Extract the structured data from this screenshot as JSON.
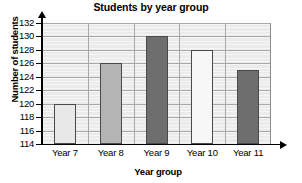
{
  "chart_data": {
    "type": "bar",
    "title": "Students by year group",
    "xlabel": "Year group",
    "ylabel": "Number of students",
    "categories": [
      "Year 7",
      "Year 8",
      "Year 9",
      "Year 10",
      "Year 11"
    ],
    "values": [
      120,
      126,
      130,
      128,
      125
    ],
    "ylim": [
      114,
      132
    ],
    "ytick_step": 2,
    "yticks": [
      114,
      116,
      118,
      120,
      122,
      124,
      126,
      128,
      130,
      132
    ],
    "ytick_labels": [
      "114",
      "116",
      "118",
      "120",
      "122",
      "124",
      "126",
      "128",
      "130",
      "132"
    ],
    "grid": true,
    "minor_grid": true,
    "legend": "none",
    "bar_colors": [
      "#e8e8e8",
      "#b4b4b4",
      "#6e6e6e",
      "#f7f7f7",
      "#6e6e6e"
    ],
    "bar_edge_color": "#4a4a4a",
    "plot_background": "#ebebeb",
    "gridline_color": "#a8a8a8",
    "axis_color": "#000000"
  }
}
